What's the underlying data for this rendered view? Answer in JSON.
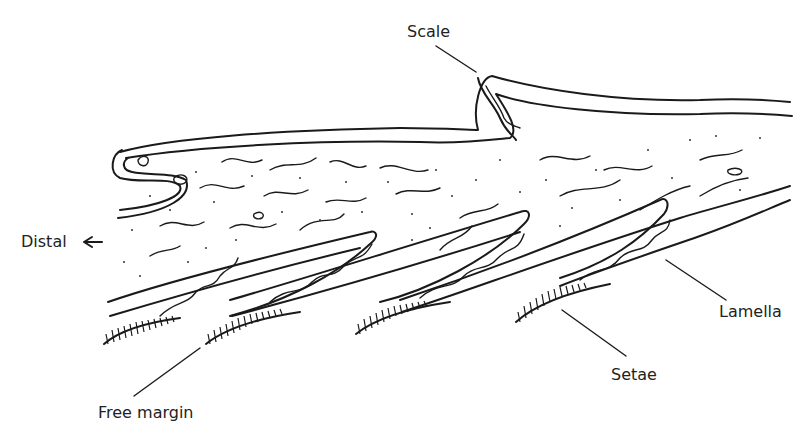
{
  "figure": {
    "ink_color": "#1a1a1a",
    "background": "#ffffff"
  },
  "labels": {
    "scale": "Scale",
    "distal": "Distal",
    "distal_arrow": "←",
    "lamella": "Lamella",
    "setae": "Setae",
    "free_margin": "Free margin"
  }
}
